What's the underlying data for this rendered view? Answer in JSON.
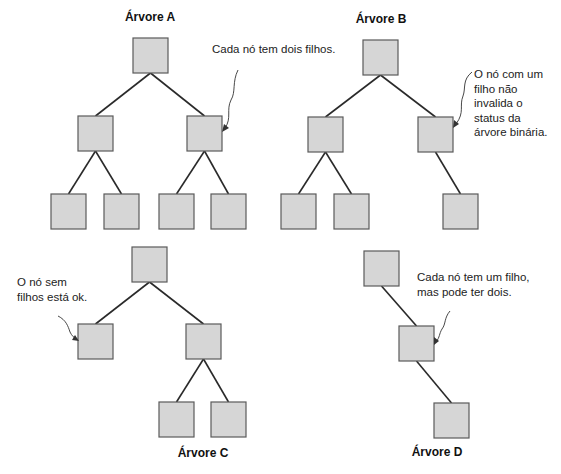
{
  "trees": [
    {
      "id": "A",
      "title": "Árvore A",
      "annotation": [
        "Cada nó tem dois filhos."
      ],
      "nodes": [
        "root",
        "l",
        "r",
        "ll",
        "lr",
        "rl",
        "rr"
      ],
      "edges": [
        [
          "root",
          "l"
        ],
        [
          "root",
          "r"
        ],
        [
          "l",
          "ll"
        ],
        [
          "l",
          "lr"
        ],
        [
          "r",
          "rl"
        ],
        [
          "r",
          "rr"
        ]
      ],
      "annotation_target": "r"
    },
    {
      "id": "B",
      "title": "Árvore B",
      "annotation": [
        "O nó com um",
        "filho não",
        "invalida o",
        "status da",
        "árvore binária."
      ],
      "nodes": [
        "root",
        "l",
        "r",
        "ll",
        "lr",
        "rr"
      ],
      "edges": [
        [
          "root",
          "l"
        ],
        [
          "root",
          "r"
        ],
        [
          "l",
          "ll"
        ],
        [
          "l",
          "lr"
        ],
        [
          "r",
          "rr"
        ]
      ],
      "annotation_target": "r"
    },
    {
      "id": "C",
      "title": "Árvore C",
      "annotation": [
        "O nó sem",
        "filhos está ok."
      ],
      "nodes": [
        "root",
        "l",
        "r",
        "rl",
        "rr"
      ],
      "edges": [
        [
          "root",
          "l"
        ],
        [
          "root",
          "r"
        ],
        [
          "r",
          "rl"
        ],
        [
          "r",
          "rr"
        ]
      ],
      "annotation_target": "l"
    },
    {
      "id": "D",
      "title": "Árvore D",
      "annotation": [
        "Cada nó tem um filho,",
        "mas pode ter dois."
      ],
      "nodes": [
        "root",
        "mid",
        "leaf"
      ],
      "edges": [
        [
          "root",
          "mid"
        ],
        [
          "mid",
          "leaf"
        ]
      ],
      "annotation_target": "mid"
    }
  ],
  "colors": {
    "node_fill": "#d6d6d6",
    "node_stroke": "#5a5a5a",
    "edge": "#2a2a2a"
  }
}
